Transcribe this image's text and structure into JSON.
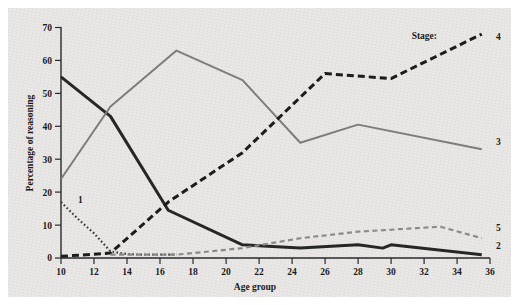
{
  "chart_data": {
    "type": "line",
    "title": "",
    "xlabel": "Age group",
    "ylabel": "Percentage of reasoning",
    "xlim": [
      10,
      36
    ],
    "ylim": [
      0,
      70
    ],
    "xticks": [
      10,
      12,
      14,
      16,
      18,
      20,
      22,
      24,
      26,
      28,
      30,
      32,
      34,
      36
    ],
    "yticks": [
      0,
      10,
      20,
      30,
      40,
      50,
      60,
      70
    ],
    "grid": false,
    "legend_position": "right-inline",
    "legend_title": "Stage:",
    "series": [
      {
        "name": "1",
        "label": "1",
        "style": "dotted",
        "color": "#3b3b3b",
        "x": [
          10,
          11,
          12,
          13,
          14,
          15,
          16,
          17
        ],
        "values": [
          17,
          12,
          7.5,
          2,
          1.2,
          1,
          1,
          1
        ]
      },
      {
        "name": "2",
        "label": "2",
        "style": "solid-thick",
        "color": "#262626",
        "x": [
          10,
          13,
          16.5,
          21,
          24.5,
          28,
          29.5,
          30,
          35.5
        ],
        "values": [
          55,
          43,
          14.5,
          4,
          3,
          4,
          3,
          4,
          1
        ]
      },
      {
        "name": "3",
        "label": "3",
        "style": "solid",
        "color": "#7c7c7c",
        "x": [
          10,
          13,
          17,
          21,
          24.5,
          28,
          35.5
        ],
        "values": [
          24,
          46,
          63,
          54,
          35,
          40.5,
          33
        ]
      },
      {
        "name": "4",
        "label": "4",
        "style": "dashed-thick",
        "color": "#1c1c1c",
        "x": [
          10,
          13,
          16.5,
          21,
          26,
          30,
          35.5
        ],
        "values": [
          0.5,
          1.5,
          17,
          32,
          56,
          54.5,
          68
        ]
      },
      {
        "name": "5",
        "label": "5",
        "style": "dashed",
        "color": "#8a8a8a",
        "x": [
          13,
          17,
          21,
          24.5,
          28,
          33,
          35.5
        ],
        "values": [
          1,
          1,
          3,
          6,
          8,
          9.5,
          6
        ]
      }
    ]
  },
  "legend": {
    "title": "Stage:",
    "entries": [
      {
        "label": "4"
      },
      {
        "label": "3"
      },
      {
        "label": "5"
      },
      {
        "label": "2"
      },
      {
        "label": "1"
      }
    ]
  }
}
